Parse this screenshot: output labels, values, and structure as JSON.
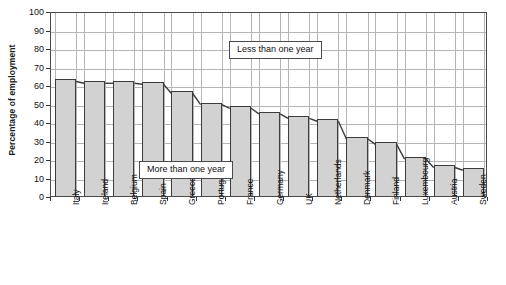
{
  "chart_data": {
    "type": "bar",
    "title": "",
    "subtitle": "",
    "xlabel": "",
    "ylabel": "Percentage of employment",
    "ylim": [
      0,
      100
    ],
    "ytick_step": 10,
    "yticks": [
      0,
      10,
      20,
      30,
      40,
      50,
      60,
      70,
      80,
      90,
      100
    ],
    "grid": true,
    "legend": "none",
    "orientation": "vertical",
    "categories": [
      "Italy",
      "Ireland",
      "Belgium",
      "Spain",
      "Greece",
      "Portugal",
      "France",
      "Germany",
      "UK",
      "Netherlands",
      "Denmark",
      "Finland",
      "Luxembourg",
      "Austria",
      "Sweden"
    ],
    "values": [
      63,
      62,
      62,
      61.5,
      56.5,
      50.5,
      48.5,
      45.5,
      43,
      41.5,
      32,
      29,
      21,
      16.5,
      15
    ],
    "series": [
      {
        "name": "More than one year",
        "values": [
          63,
          62,
          62,
          61.5,
          56.5,
          50.5,
          48.5,
          45.5,
          43,
          41.5,
          32,
          29,
          21,
          16.5,
          15
        ]
      }
    ],
    "annotations": [
      {
        "text": "Less than one year",
        "region": "above-bars"
      },
      {
        "text": "More than one year",
        "region": "inside-bars"
      }
    ],
    "bar_fill_color": "#d2d2d2",
    "bar_edge_color": "#3c3c3c",
    "gridline_color": "#b5b5b5",
    "frame_color": "#4a4a4a"
  },
  "axis": {
    "y_title": "Percentage of employment",
    "y_tick_labels": [
      "100",
      "90",
      "80",
      "70",
      "60",
      "50",
      "40",
      "30",
      "20",
      "10",
      "0"
    ]
  },
  "annotations": {
    "less_than_one_year": "Less than one year",
    "more_than_one_year": "More than one year"
  }
}
